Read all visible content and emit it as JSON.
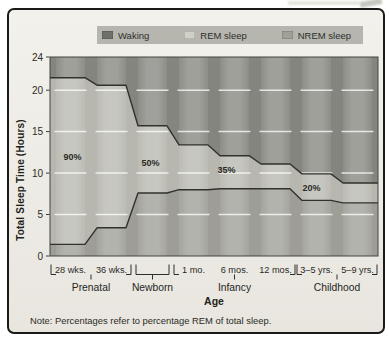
{
  "panel": {
    "bg_top": "#f3f1eb",
    "bg_bottom": "#e8e6df",
    "border": "#1a1a1a"
  },
  "legend": {
    "bg": "#b6b6af",
    "items": [
      {
        "label": "Waking",
        "color": "#70706b"
      },
      {
        "label": "REM sleep",
        "color": "#d0d0c8"
      },
      {
        "label": "NREM sleep",
        "color": "#a0a099"
      }
    ]
  },
  "axes": {
    "y_title": "Total Sleep Time (Hours)",
    "x_title": "Age",
    "y_ticks": [
      24,
      20,
      15,
      10,
      5,
      0
    ],
    "gridline_values": [
      5,
      10,
      15,
      20
    ]
  },
  "note": "Note: Percentages refer to percentage REM of total sleep.",
  "chart_data": {
    "type": "area",
    "title": "",
    "xlabel": "Age",
    "ylabel": "Total Sleep Time (Hours)",
    "ylim": [
      0,
      24
    ],
    "y_ticks": [
      0,
      5,
      10,
      15,
      20,
      24
    ],
    "grid": "white dashed segments per column at 5,10,15,20",
    "legend_position": "top",
    "categories": [
      "28 wks.",
      "36 wks.",
      "Newborn",
      "1 mo.",
      "6 mos.",
      "12 mos.",
      "3–5 yrs.",
      "5–9 yrs."
    ],
    "groups": [
      {
        "label": "Prenatal",
        "from": 0,
        "to": 1
      },
      {
        "label": "Newborn",
        "from": 2,
        "to": 2
      },
      {
        "label": "Infancy",
        "from": 3,
        "to": 5
      },
      {
        "label": "Childhood",
        "from": 6,
        "to": 7
      }
    ],
    "series": [
      {
        "name": "Total sleep time (hours, upper line)",
        "values": [
          21.5,
          20.6,
          15.7,
          13.4,
          12.1,
          11.1,
          9.9,
          8.8
        ]
      },
      {
        "name": "NREM sleep (hours, lower line)",
        "values": [
          1.4,
          3.4,
          7.6,
          8.0,
          8.1,
          8.1,
          6.7,
          6.4
        ]
      }
    ],
    "regions": [
      {
        "name": "Waking",
        "location": "above upper line"
      },
      {
        "name": "REM sleep",
        "location": "between lines"
      },
      {
        "name": "NREM sleep",
        "location": "below lower line"
      }
    ],
    "rem_percent_labels": [
      {
        "text": "90%",
        "col": 0,
        "hours": 12.0,
        "dx": 2
      },
      {
        "text": "50%",
        "col": 2,
        "hours": 11.2,
        "dx": -2
      },
      {
        "text": "35%",
        "col": 4,
        "hours": 10.4,
        "dx": -8
      },
      {
        "text": "20%",
        "col": 6,
        "hours": 8.25,
        "dx": -5
      }
    ],
    "colors": {
      "waking": "#85857f",
      "rem": "#b7b7af",
      "nrem": "#9e9e97",
      "line": "#32322d",
      "gridline": "rgba(255,255,255,0.75)",
      "bar_highlight": "rgba(255,255,255,0.22)",
      "text": "#2b2b28"
    }
  }
}
